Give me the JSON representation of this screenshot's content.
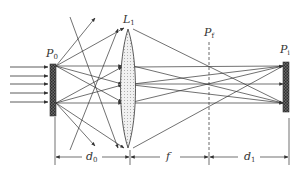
{
  "diagram": {
    "title": "",
    "type": "optical imaging setup",
    "colors": {
      "line": "#3a3a3a",
      "plate_fill": "#555555",
      "lens_fill": "#e8e8e8",
      "background": "#ffffff"
    },
    "labels": {
      "source_plane": {
        "main": "P",
        "sub": "0"
      },
      "lens": {
        "main": "L",
        "sub": "1"
      },
      "focal_plane": {
        "main": "P",
        "sub": "f"
      },
      "image_plane": {
        "main": "P",
        "sub": "i"
      },
      "dim_object_distance": {
        "main": "d",
        "sub": "0"
      },
      "dim_focal_length": {
        "main": "f",
        "sub": ""
      },
      "dim_image_distance": {
        "main": "d",
        "sub": "1"
      }
    },
    "elements": [
      {
        "id": "incident-beams",
        "description": "5 parallel arrows entering from the left onto plane P0"
      },
      {
        "id": "source-plate-P0",
        "description": "hatched plate at object plane"
      },
      {
        "id": "lens-L1",
        "description": "biconvex lens, dotted fill"
      },
      {
        "id": "focal-plane-Pf",
        "description": "dashed vertical line at back focal plane"
      },
      {
        "id": "image-plate-Pi",
        "description": "hatched plate at image plane"
      }
    ],
    "dimensions": [
      {
        "label": "d0",
        "from": "P0",
        "to": "L1"
      },
      {
        "label": "f",
        "from": "L1",
        "to": "Pf"
      },
      {
        "label": "d1",
        "from": "Pf",
        "to": "Pi"
      }
    ]
  }
}
